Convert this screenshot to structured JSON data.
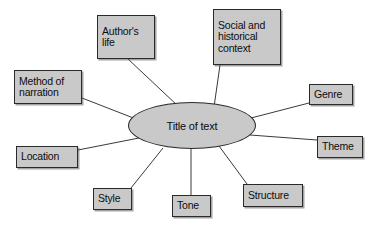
{
  "diagram": {
    "type": "spider-map",
    "title_node": {
      "id": "title-of-text",
      "label": "Title of text",
      "shape": "ellipse",
      "fill": "#c9c9c9",
      "stroke": "#2a2a2a",
      "x": 128,
      "y": 102,
      "width": 128,
      "height": 47
    },
    "background": "#ffffff",
    "node_fill": "#c9c9c9",
    "node_stroke": "#2a2a2a",
    "edge_stroke": "#3a3a3a",
    "nodes": [
      {
        "id": "authors-life",
        "label": "Author's\nlife",
        "x": 97,
        "y": 15,
        "width": 58,
        "height": 44,
        "anchor_x": 128,
        "anchor_y": 59,
        "hub_x": 178,
        "hub_y": 106
      },
      {
        "id": "social-historical-context",
        "label": "Social and\nhistorical\ncontext",
        "x": 213,
        "y": 9,
        "width": 68,
        "height": 56,
        "anchor_x": 220,
        "anchor_y": 65,
        "hub_x": 214,
        "hub_y": 107
      },
      {
        "id": "method-of-narration",
        "label": "Method of\nnarration",
        "x": 14,
        "y": 70,
        "width": 68,
        "height": 34,
        "anchor_x": 82,
        "anchor_y": 98,
        "hub_x": 136,
        "hub_y": 119
      },
      {
        "id": "genre",
        "label": "Genre",
        "x": 309,
        "y": 84,
        "width": 44,
        "height": 21,
        "anchor_x": 309,
        "anchor_y": 103,
        "hub_x": 251,
        "hub_y": 118
      },
      {
        "id": "location",
        "label": "Location",
        "x": 16,
        "y": 146,
        "width": 62,
        "height": 22,
        "anchor_x": 78,
        "anchor_y": 150,
        "hub_x": 139,
        "hub_y": 138
      },
      {
        "id": "theme",
        "label": "Theme",
        "x": 317,
        "y": 136,
        "width": 46,
        "height": 22,
        "anchor_x": 317,
        "anchor_y": 140,
        "hub_x": 250,
        "hub_y": 135
      },
      {
        "id": "style",
        "label": "Style",
        "x": 93,
        "y": 188,
        "width": 39,
        "height": 22,
        "anchor_x": 131,
        "anchor_y": 188,
        "hub_x": 163,
        "hub_y": 148
      },
      {
        "id": "tone",
        "label": "Tone",
        "x": 172,
        "y": 195,
        "width": 39,
        "height": 22,
        "anchor_x": 191,
        "anchor_y": 195,
        "hub_x": 191,
        "hub_y": 149
      },
      {
        "id": "structure",
        "label": "Structure",
        "x": 243,
        "y": 184,
        "width": 60,
        "height": 23,
        "anchor_x": 247,
        "anchor_y": 184,
        "hub_x": 219,
        "hub_y": 146
      }
    ]
  }
}
